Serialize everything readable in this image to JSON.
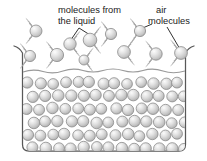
{
  "figure": {
    "background_color": "#ffffff",
    "outline_color": "#4d4d4d",
    "molecule_fill_light": "#f2f2f2",
    "molecule_fill_dark": "#b9b9b9",
    "molecule_stroke": "#8c8c8c",
    "motion_arc_color": "#a8a8a8",
    "text_color": "#1a1a1a",
    "surface_line_color": "#9a9a9a"
  },
  "labels": {
    "left": {
      "name": "molecules-from-the-liquid-label",
      "line1": "molecules from",
      "line2": "the liquid",
      "x": 58,
      "y": 13
    },
    "right": {
      "name": "air-molecules-label",
      "line1": "air",
      "line2": "molecules",
      "x": 155,
      "y": 11
    }
  },
  "leader_lines": {
    "left_to_vapor_a": "M 80 26 L 71 44",
    "left_to_vapor_b": "M 80 26 L 90 40",
    "right_to_vapor_a": "M 154 24 L 140 31",
    "right_to_vapor_b": "M 170 26 L 181 47"
  },
  "container": {
    "name": "beaker",
    "left_wall_x": 22,
    "right_wall_x": 186,
    "bottom_y": 152,
    "rim_y": 47,
    "corner_radius": 7,
    "liquid_surface_y": 72
  },
  "vapor_molecules": [
    {
      "cx": 36,
      "cy": 31,
      "r": 6.0,
      "arc": "left"
    },
    {
      "cx": 30,
      "cy": 56,
      "r": 5.6,
      "arc": "left"
    },
    {
      "cx": 57,
      "cy": 55,
      "r": 6.6,
      "arc": "left"
    },
    {
      "cx": 70,
      "cy": 44,
      "r": 6.2,
      "arc": "right"
    },
    {
      "cx": 90,
      "cy": 40,
      "r": 6.8,
      "arc": "right"
    },
    {
      "cx": 84,
      "cy": 60,
      "r": 5.0,
      "arc": "right"
    },
    {
      "cx": 111,
      "cy": 34,
      "r": 5.6,
      "arc": "left"
    },
    {
      "cx": 124,
      "cy": 52,
      "r": 6.4,
      "arc": "right"
    },
    {
      "cx": 140,
      "cy": 31,
      "r": 5.6,
      "arc": "left"
    },
    {
      "cx": 156,
      "cy": 54,
      "r": 6.2,
      "arc": "left"
    },
    {
      "cx": 181,
      "cy": 53,
      "r": 6.4,
      "arc": "left"
    }
  ],
  "liquid_molecule_grid": {
    "rows": 6,
    "start_y": 83,
    "row_spacing": 13.0,
    "col_spacing": 12.6,
    "radius": 5.6,
    "x_start": 27,
    "stagger_offset": 6.3,
    "jitter_seed": 7
  },
  "counts": {
    "vapor_molecules_visible": 11,
    "liquid_rows": 6
  }
}
